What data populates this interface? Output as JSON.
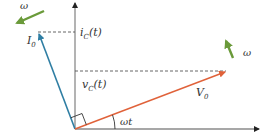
{
  "diagram": {
    "type": "phasor-diagram",
    "colors": {
      "axis": "#8a8a8a",
      "axis_head": "#222222",
      "current_phasor": "#2f7ea3",
      "voltage_phasor": "#e0623a",
      "rotation_arrow": "#6a9a3a",
      "dashed": "#555555",
      "text": "#333333"
    },
    "labels": {
      "omega_top_left": "ω",
      "omega_right": "ω",
      "current_amplitude": "I",
      "current_amplitude_sub": "0",
      "current_projection": "i",
      "current_projection_sub": "C",
      "current_projection_arg": "(t)",
      "voltage_projection": "v",
      "voltage_projection_sub": "C",
      "voltage_projection_arg": "(t)",
      "voltage_amplitude": "V",
      "voltage_amplitude_sub": "0",
      "angle": "ωt"
    },
    "elements": [
      {
        "name": "vertical-axis",
        "description": "vertical projection axis"
      },
      {
        "name": "horizontal-axis",
        "description": "horizontal reference axis"
      },
      {
        "name": "current-phasor",
        "label": "I0",
        "description": "current phasor leading voltage by 90°"
      },
      {
        "name": "voltage-phasor",
        "label": "V0",
        "description": "voltage phasor at angle ωt"
      },
      {
        "name": "right-angle-marker",
        "description": "90° between I0 and V0"
      },
      {
        "name": "rotation-arrows",
        "label": "ω",
        "description": "counterclockwise rotation"
      }
    ]
  }
}
